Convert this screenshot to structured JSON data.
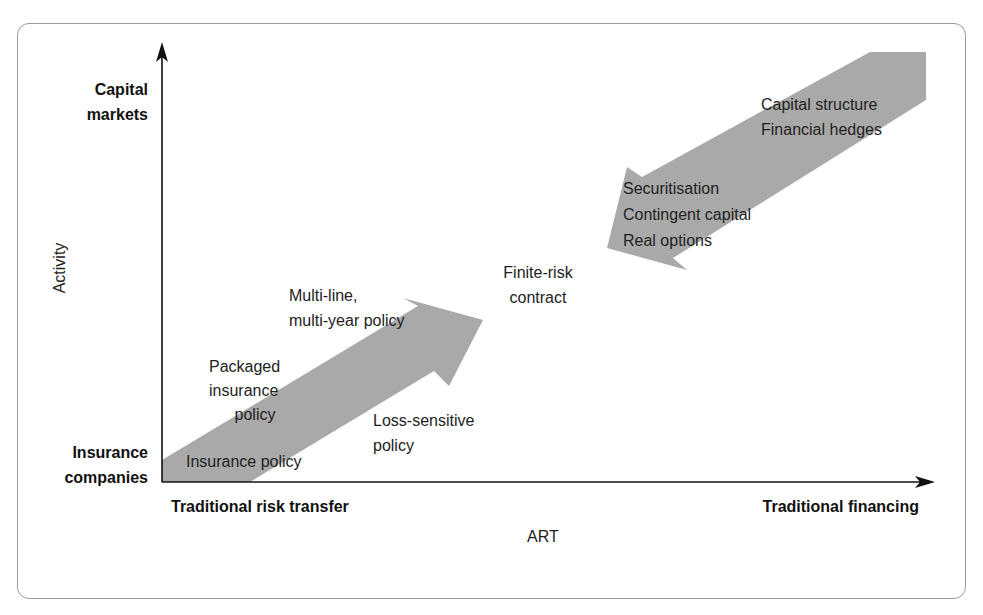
{
  "diagram": {
    "y_axis": {
      "title": "Activity",
      "top_label": [
        "Capital",
        "markets"
      ],
      "bottom_label": [
        "Insurance",
        "companies"
      ]
    },
    "x_axis": {
      "title": "ART",
      "left_label": "Traditional risk transfer",
      "right_label": "Traditional financing"
    },
    "arrows": [
      {
        "id": "risk-transfer-arrow",
        "direction": "up-right",
        "color": "#a9a9a9",
        "labels": [
          "Insurance policy",
          "Packaged insurance policy",
          "Multi-line, multi-year policy",
          "Loss-sensitive policy"
        ]
      },
      {
        "id": "financing-arrow",
        "direction": "down-left",
        "color": "#a9a9a9",
        "labels": [
          "Capital structure",
          "Financial hedges",
          "Securitisation",
          "Contingent capital",
          "Real options"
        ]
      }
    ],
    "items": {
      "insurance_policy": "Insurance policy",
      "packaged": [
        "Packaged",
        "insurance",
        "policy"
      ],
      "multi_line": [
        "Multi-line,",
        "multi-year policy"
      ],
      "loss_sensitive": [
        "Loss-sensitive",
        "policy"
      ],
      "finite_risk": [
        "Finite-risk",
        "contract"
      ],
      "capital_structure": "Capital structure",
      "financial_hedges": "Financial hedges",
      "securitisation": "Securitisation",
      "contingent_capital": "Contingent capital",
      "real_options": "Real options"
    },
    "colors": {
      "arrow_fill": "#a9a9a9",
      "axis": "#111111",
      "frame_border": "#9a9a9a",
      "text": "#222222"
    }
  }
}
